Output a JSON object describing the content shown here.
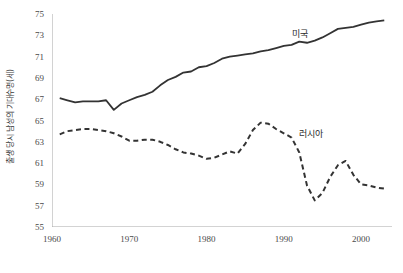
{
  "chart_data": {
    "type": "line",
    "title": "",
    "xlabel": "",
    "ylabel": "출생 당시 남성의 기대수명(세)",
    "xlim": [
      1960,
      2004
    ],
    "ylim": [
      55,
      75
    ],
    "y_ticks": [
      55,
      57,
      59,
      61,
      63,
      65,
      67,
      69,
      71,
      73,
      75
    ],
    "x_ticks": [
      1960,
      1970,
      1980,
      1990,
      2000
    ],
    "grid": false,
    "legend_position": "inline-annotation",
    "x": [
      1961,
      1962,
      1963,
      1964,
      1965,
      1966,
      1967,
      1968,
      1969,
      1970,
      1971,
      1972,
      1973,
      1974,
      1975,
      1976,
      1977,
      1978,
      1979,
      1980,
      1981,
      1982,
      1983,
      1984,
      1985,
      1986,
      1987,
      1988,
      1989,
      1990,
      1991,
      1992,
      1993,
      1994,
      1995,
      1996,
      1997,
      1998,
      1999,
      2000,
      2001,
      2002,
      2003
    ],
    "series": [
      {
        "name": "미국",
        "style": "solid",
        "color": "#333333",
        "values": [
          67.1,
          66.9,
          66.7,
          66.8,
          66.8,
          66.8,
          66.9,
          66.0,
          66.6,
          66.9,
          67.2,
          67.4,
          67.7,
          68.3,
          68.8,
          69.1,
          69.5,
          69.6,
          70.0,
          70.1,
          70.4,
          70.8,
          71.0,
          71.1,
          71.2,
          71.3,
          71.5,
          71.6,
          71.8,
          72.0,
          72.1,
          72.4,
          72.3,
          72.5,
          72.8,
          73.2,
          73.6,
          73.7,
          73.8,
          74.0,
          74.2,
          74.3,
          74.4
        ]
      },
      {
        "name": "러시아",
        "style": "dashed",
        "color": "#333333",
        "values": [
          63.7,
          64.0,
          64.1,
          64.2,
          64.2,
          64.1,
          64.0,
          63.8,
          63.5,
          63.1,
          63.1,
          63.2,
          63.2,
          63.0,
          62.7,
          62.3,
          62.0,
          61.9,
          61.7,
          61.4,
          61.5,
          61.8,
          62.1,
          61.9,
          62.8,
          64.1,
          64.8,
          64.7,
          64.2,
          63.8,
          63.4,
          62.0,
          58.9,
          57.5,
          58.2,
          59.7,
          60.8,
          61.2,
          59.9,
          59.0,
          58.9,
          58.7,
          58.6
        ]
      }
    ],
    "annotations": [
      {
        "name": "미국",
        "x": 1991,
        "y": 73.1
      },
      {
        "name": "러시아",
        "x": 1992,
        "y": 63.7
      }
    ]
  },
  "axis": {
    "y_title": "출생 당시 남성의 기대수명(세)",
    "y_tick_labels": [
      "75",
      "73",
      "71",
      "69",
      "67",
      "65",
      "63",
      "61",
      "59",
      "57",
      "55"
    ],
    "x_tick_labels": [
      "1960",
      "1970",
      "1980",
      "1990",
      "2000"
    ]
  },
  "annotations": {
    "usa_label": "미국",
    "russia_label": "러시아"
  },
  "colors": {
    "line": "#333333",
    "axis": "#a6a6a6",
    "tick_text": "#4a4a4a"
  }
}
